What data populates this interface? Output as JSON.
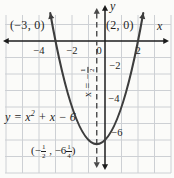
{
  "colors": {
    "background": "#fbfbf9",
    "grid": "#cdd0d4",
    "axis": "#1c1c1c",
    "curve": "#3d3d3d",
    "dashed": "#4a4a4a",
    "text": "#1e1e1e"
  },
  "chart_data": {
    "type": "line",
    "title": "",
    "equation": "y = x² + x − 6",
    "coefficients": {
      "a": 1,
      "b": 1,
      "c": -6
    },
    "x_intercepts": [
      [
        -3,
        0
      ],
      [
        2,
        0
      ]
    ],
    "vertex": [
      -0.5,
      -6.25
    ],
    "axis_of_symmetry_x": -0.5,
    "x_tick_values": [
      -4,
      -2,
      0,
      2
    ],
    "y_tick_values": [
      -2,
      -4,
      -6
    ],
    "x_range": [
      -6.1,
      4.1
    ],
    "y_range": [
      -8.1,
      1.7
    ],
    "grid": true,
    "xlabel": "x",
    "ylabel": "y",
    "legend": "none"
  },
  "labels": {
    "root_left": "(−3, 0)",
    "root_right": "(2, 0)",
    "axis_x": "x",
    "axis_y": "y",
    "equation_prefix": "y = x",
    "equation_exponent": "2",
    "equation_suffix": " + x − 6",
    "x_ticks": [
      "−4",
      "−2",
      "0",
      "2"
    ],
    "y_ticks": [
      "−2",
      "−4",
      "−6"
    ],
    "vertex": {
      "open": "(−",
      "frac1_num": "1",
      "frac1_den": "2",
      "mid": " , −6",
      "frac2_num": "1",
      "frac2_den": "4",
      "close": ")"
    },
    "symmetry": {
      "prefix": "x = −",
      "num": "1",
      "den": "2"
    }
  }
}
